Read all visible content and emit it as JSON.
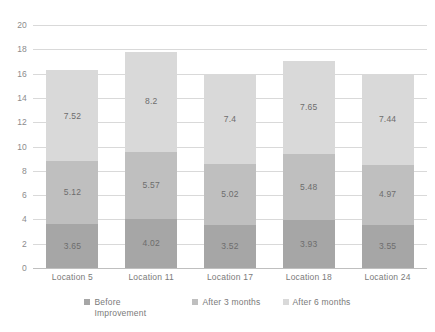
{
  "chart_data": {
    "type": "bar",
    "subtype": "stacked-vertical",
    "title": "",
    "xlabel": "",
    "ylabel": "",
    "ylim": [
      0,
      20
    ],
    "y_ticks": [
      0,
      2,
      4,
      6,
      8,
      10,
      12,
      14,
      16,
      18,
      20
    ],
    "grid": true,
    "legend_position": "bottom",
    "categories": [
      "Location 5",
      "Location 11",
      "Location 17",
      "Location 18",
      "Location 24"
    ],
    "series": [
      {
        "name": "Before Improvement",
        "color": "#a6a6a6",
        "values": [
          3.65,
          4.02,
          3.52,
          3.93,
          3.55
        ],
        "labels": [
          "3.65",
          "4.02",
          "3.52",
          "3.93",
          "3.55"
        ]
      },
      {
        "name": "After 3 months",
        "color": "#bfbfbf",
        "values": [
          5.12,
          5.57,
          5.02,
          5.48,
          4.97
        ],
        "labels": [
          "5.12",
          "5.57",
          "5.02",
          "5.48",
          "4.97"
        ]
      },
      {
        "name": "After 6 months",
        "color": "#d9d9d9",
        "values": [
          7.52,
          8.2,
          7.4,
          7.65,
          7.44
        ],
        "labels": [
          "7.52",
          "8.2",
          "7.4",
          "7.65",
          "7.44"
        ]
      }
    ],
    "totals": [
      16.29,
      17.79,
      15.94,
      17.06,
      15.96
    ]
  },
  "legend": {
    "items": [
      {
        "label": "Before Improvement",
        "color": "#a6a6a6"
      },
      {
        "label": "After 3 months",
        "color": "#bfbfbf"
      },
      {
        "label": "After 6 months",
        "color": "#d9d9d9"
      }
    ]
  },
  "axis": {
    "y_tick_labels": [
      "0",
      "2",
      "4",
      "6",
      "8",
      "10",
      "12",
      "14",
      "16",
      "18",
      "20"
    ]
  }
}
